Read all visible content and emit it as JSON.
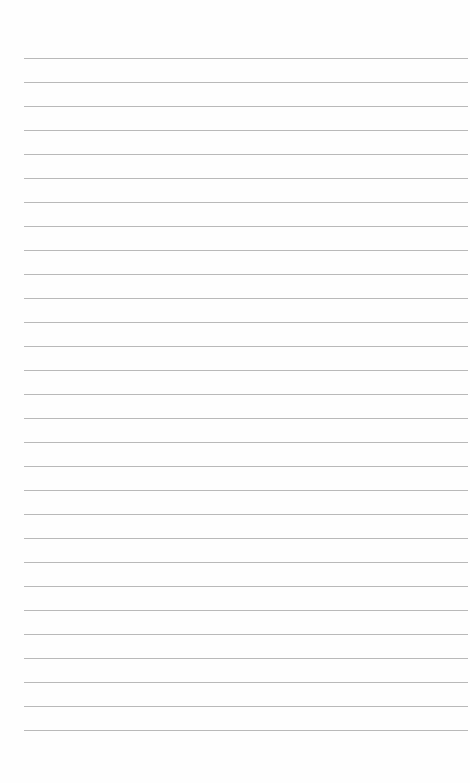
{
  "page": {
    "type": "blank lined paper",
    "rule_count": 29,
    "rule_start_y": 58,
    "rule_spacing": 24,
    "rule_color": "#b9b9b9",
    "background": "#fefefe"
  }
}
